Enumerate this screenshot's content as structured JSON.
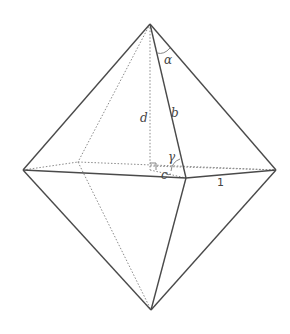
{
  "diagram": {
    "type": "octahedron-bipyramid",
    "labels": {
      "alpha": "α",
      "b": "b",
      "d": "d",
      "gamma": "γ",
      "c": "c",
      "one": "1"
    },
    "colors": {
      "edge": "#4a4a4a",
      "hidden_edge": "#8a8a8a",
      "background": "#ffffff"
    }
  }
}
